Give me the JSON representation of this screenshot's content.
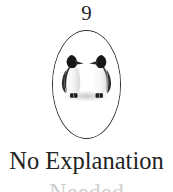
{
  "page": {
    "background_color": "#ffffff",
    "text_color": "#232323",
    "width": 173,
    "height": 192
  },
  "figure": {
    "number": "9",
    "frame_shape": "oval",
    "frame_color": "#2b2b2b",
    "illustration_name": "two-penguins-facing-each-other",
    "illustration_description": "Two king penguins standing on snow, facing one another with beaks nearly touching",
    "penguins": [
      {
        "name": "penguin-left",
        "facing": "right",
        "body_color": "#f2f2f2",
        "back_color": "#3a3a3a",
        "head_color": "#1f1f1f",
        "beak_color": "#2a2a2a",
        "feet_color": "#1c1c1c"
      },
      {
        "name": "penguin-right",
        "facing": "left",
        "body_color": "#f2f2f2",
        "back_color": "#3a3a3a",
        "head_color": "#1f1f1f",
        "beak_color": "#2a2a2a",
        "feet_color": "#1c1c1c"
      }
    ],
    "ground_shadow_color": "#d8d8d8"
  },
  "caption": {
    "line_1": "No Explanation",
    "line_2": "Needed",
    "line_2_visibility": "clipped-at-bottom-edge"
  }
}
